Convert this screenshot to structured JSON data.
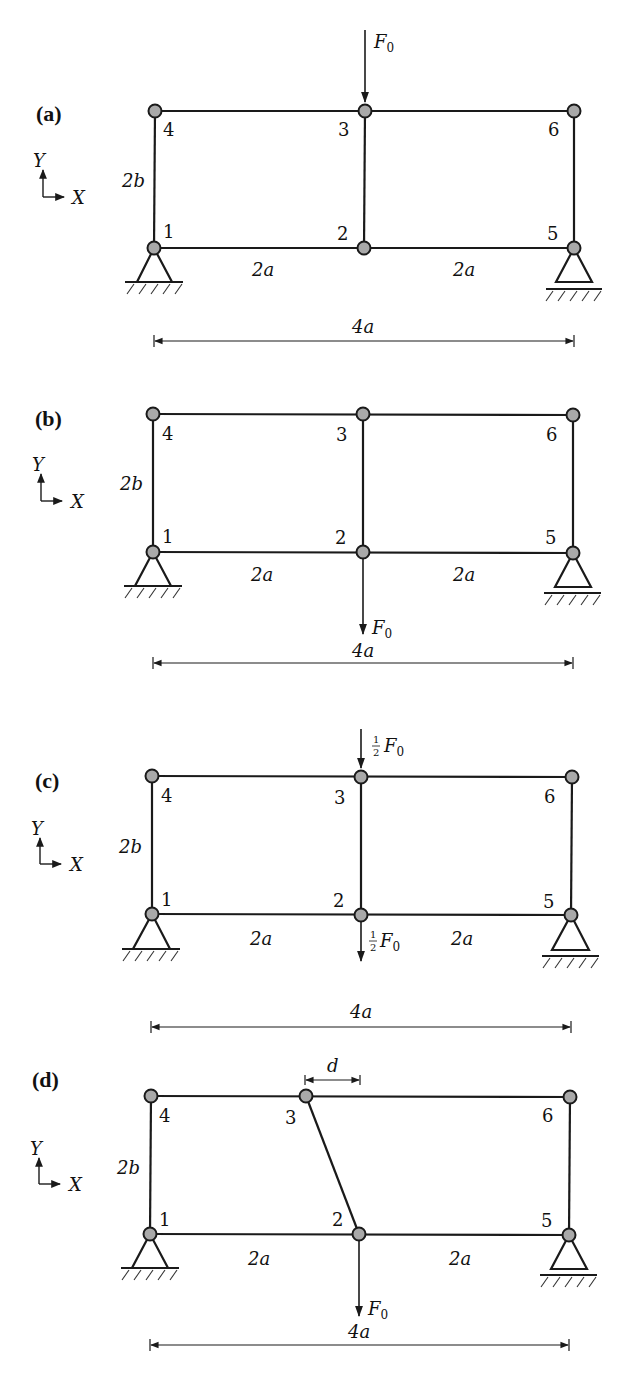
{
  "figure": {
    "axes": {
      "x_label": "X",
      "y_label": "Y"
    },
    "dimensions": {
      "height": "2b",
      "bay_left": "2a",
      "bay_right": "2a",
      "total": "4a",
      "offset": "d"
    },
    "node_labels": [
      "1",
      "2",
      "3",
      "4",
      "5",
      "6"
    ],
    "colors": {
      "member": "#1a1a1a",
      "node_fill": "#a9a9a9",
      "background": "#ffffff"
    }
  },
  "panels": [
    {
      "label": "(a)",
      "load": {
        "text": "F",
        "sub": "0",
        "frac": "",
        "at_node": "3",
        "direction": "down-onto-node"
      }
    },
    {
      "label": "(b)",
      "load": {
        "text": "F",
        "sub": "0",
        "frac": "",
        "at_node": "2",
        "direction": "down-from-node"
      }
    },
    {
      "label": "(c)",
      "load_top": {
        "text": "F",
        "sub": "0",
        "frac_num": "1",
        "frac_den": "2",
        "at_node": "3"
      },
      "load_bottom": {
        "text": "F",
        "sub": "0",
        "frac_num": "1",
        "frac_den": "2",
        "at_node": "2"
      }
    },
    {
      "label": "(d)",
      "load": {
        "text": "F",
        "sub": "0",
        "frac": "",
        "at_node": "2",
        "direction": "down-from-node"
      },
      "offset_label": "d"
    }
  ]
}
